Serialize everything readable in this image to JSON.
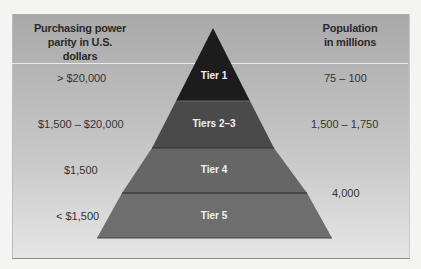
{
  "headers": {
    "left_line1": "Purchasing power",
    "left_line2": "parity in U.S. dollars",
    "right_line1": "Population",
    "right_line2": "in millions"
  },
  "tiers": [
    {
      "label": "Tier 1",
      "ppp": "> $20,000",
      "population": "75 – 100",
      "color": "#1c1c1c"
    },
    {
      "label": "Tiers 2–3",
      "ppp": "$1,500 – $20,000",
      "population": "1,500 – 1,750",
      "color": "#4a4a4a"
    },
    {
      "label": "Tier 4",
      "ppp": "$1,500",
      "population": "",
      "color": "#666666"
    },
    {
      "label": "Tier 5",
      "ppp": "< $1,500",
      "population": "",
      "color": "#6e6e6e"
    }
  ],
  "combined_population_tiers_4_5": "4,000"
}
